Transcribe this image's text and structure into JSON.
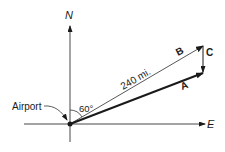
{
  "axes": {
    "north_label": "N",
    "east_label": "E"
  },
  "origin": {
    "label": "Airport"
  },
  "angle": {
    "label": "60°"
  },
  "vectors": {
    "A": {
      "label": "A"
    },
    "B": {
      "label": "B",
      "magnitude_label": "240 mi."
    },
    "C": {
      "label": "C"
    }
  },
  "colors": {
    "line": "#1a1a1a",
    "thin_line": "#444444",
    "background": "#ffffff"
  }
}
